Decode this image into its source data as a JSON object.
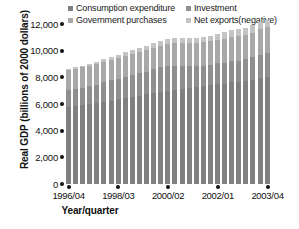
{
  "chart_data": {
    "type": "bar",
    "stacked": true,
    "title": "",
    "xlabel": "Year/quarter",
    "ylabel": "Real GDP (billions of 2000 dollars)",
    "ylim": [
      0,
      12000
    ],
    "yticks": [
      "0",
      "2,000",
      "4,000",
      "6,000",
      "8,000",
      "10,000",
      "12,000"
    ],
    "ytick_values": [
      0,
      2000,
      4000,
      6000,
      8000,
      10000,
      12000
    ],
    "grid": false,
    "legend_position": "top",
    "xtick_labels": [
      "1996/04",
      "1998/03",
      "2000/02",
      "2002/01",
      "2003/04"
    ],
    "xtick_indices": [
      0,
      7,
      14,
      21,
      28
    ],
    "categories": [
      "1996/04",
      "1997/01",
      "1997/02",
      "1997/03",
      "1997/04",
      "1998/01",
      "1998/02",
      "1998/03",
      "1998/04",
      "1999/01",
      "1999/02",
      "1999/03",
      "1999/04",
      "2000/01",
      "2000/02",
      "2000/03",
      "2000/04",
      "2001/01",
      "2001/02",
      "2001/03",
      "2001/04",
      "2002/01",
      "2002/02",
      "2002/03",
      "2002/04",
      "2003/01",
      "2003/02",
      "2003/03",
      "2003/04"
    ],
    "series": [
      {
        "name": "Consumption expenditure",
        "color": "#808080",
        "values": [
          5800,
          5850,
          5900,
          5980,
          6060,
          6150,
          6250,
          6340,
          6440,
          6530,
          6630,
          6720,
          6840,
          6930,
          7010,
          7080,
          7130,
          7200,
          7260,
          7330,
          7420,
          7480,
          7530,
          7620,
          7660,
          7720,
          7810,
          7950,
          8030
        ]
      },
      {
        "name": "Investment",
        "color": "#8f8f8f",
        "values": [
          1250,
          1280,
          1330,
          1360,
          1400,
          1470,
          1520,
          1540,
          1600,
          1640,
          1670,
          1700,
          1760,
          1810,
          1830,
          1800,
          1740,
          1650,
          1580,
          1550,
          1520,
          1560,
          1580,
          1590,
          1600,
          1620,
          1680,
          1760,
          1820
        ]
      },
      {
        "name": "Government purchases",
        "color": "#a8a8a8",
        "values": [
          1500,
          1505,
          1515,
          1525,
          1535,
          1545,
          1555,
          1560,
          1575,
          1590,
          1600,
          1610,
          1630,
          1640,
          1650,
          1665,
          1680,
          1700,
          1720,
          1740,
          1760,
          1780,
          1800,
          1815,
          1830,
          1845,
          1865,
          1885,
          1900
        ]
      },
      {
        "name": "Net exports(negative)",
        "color": "#c4c4c4",
        "values": [
          -110,
          -120,
          -135,
          -150,
          -165,
          -185,
          -210,
          -230,
          -250,
          -265,
          -290,
          -310,
          -340,
          -370,
          -395,
          -410,
          -420,
          -400,
          -405,
          -415,
          -430,
          -450,
          -480,
          -500,
          -515,
          -530,
          -545,
          -555,
          -560
        ]
      }
    ]
  },
  "legend": {
    "entries": [
      {
        "label": "Consumption expenditure",
        "color": "#808080",
        "icon": "square-swatch-icon"
      },
      {
        "label": "Investment",
        "color": "#8f8f8f",
        "icon": "square-swatch-icon"
      },
      {
        "label": "Government purchases",
        "color": "#a8a8a8",
        "icon": "square-swatch-icon"
      },
      {
        "label": "Net exports(negative)",
        "color": "#c4c4c4",
        "icon": "square-swatch-icon"
      }
    ]
  }
}
